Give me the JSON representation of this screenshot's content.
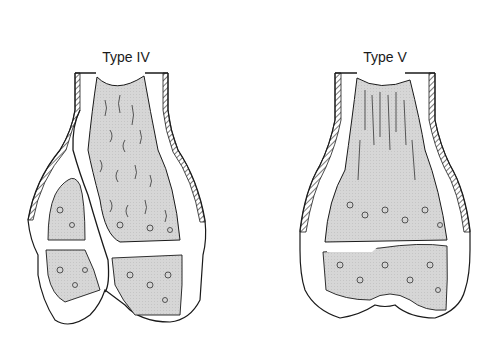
{
  "figure": {
    "panels": [
      {
        "id": "type-iv",
        "label": "Type IV",
        "description": "Fracture line crossing metaphysis, physis and epiphysis of distal femur"
      },
      {
        "id": "type-v",
        "label": "Type V",
        "description": "Crush injury of the physis of distal femur"
      }
    ],
    "colors": {
      "outline": "#1a1a1a",
      "cancellous_fill": "#d9d9d9",
      "background": "#ffffff"
    }
  }
}
